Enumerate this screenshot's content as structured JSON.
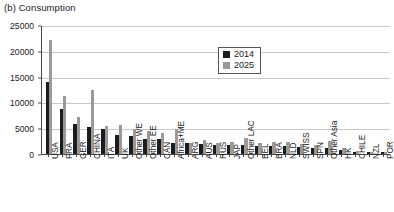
{
  "chart_data": {
    "type": "bar",
    "title": "(b) Consumption",
    "xlabel": "",
    "ylabel": "",
    "ylim": [
      0,
      25000
    ],
    "yticks": [
      0,
      5000,
      10000,
      15000,
      20000,
      25000
    ],
    "ytick_labels": [
      "0",
      "5000",
      "10000",
      "15000",
      "20000",
      "25000"
    ],
    "grid": true,
    "legend_position": "upper-center-right",
    "categories": [
      "USA",
      "FRA",
      "GER",
      "CHINA",
      "ITA",
      "UK",
      "Other WE",
      "Other EE",
      "CAN",
      "Africa+ME",
      "ARG",
      "AUS",
      "RUS",
      "JAP",
      "Other LAC",
      "BEL",
      "BRA",
      "NLD",
      "SWISS",
      "SPN",
      "Other Asia",
      "HK",
      "CHILE",
      "NZL",
      "POR"
    ],
    "series": [
      {
        "name": "2014",
        "color": "#1c1c1c",
        "values": [
          13900,
          8800,
          5800,
          5200,
          4800,
          3700,
          3500,
          2950,
          2850,
          2200,
          2050,
          1900,
          1800,
          1750,
          1700,
          1650,
          1550,
          1500,
          1400,
          1250,
          1100,
          800,
          420,
          380,
          330
        ]
      },
      {
        "name": "2025",
        "color": "#9a9a9a",
        "values": [
          22000,
          11300,
          7100,
          12400,
          5500,
          5700,
          4800,
          4450,
          4050,
          4800,
          2150,
          2650,
          2200,
          2350,
          3200,
          2100,
          2250,
          2350,
          1900,
          1800,
          2500,
          1100,
          520,
          480,
          430
        ]
      }
    ]
  },
  "legend": {
    "entries": [
      {
        "label": "2014",
        "swatch": "legend-swatch-2014"
      },
      {
        "label": "2025",
        "swatch": "legend-swatch-2025"
      }
    ]
  }
}
